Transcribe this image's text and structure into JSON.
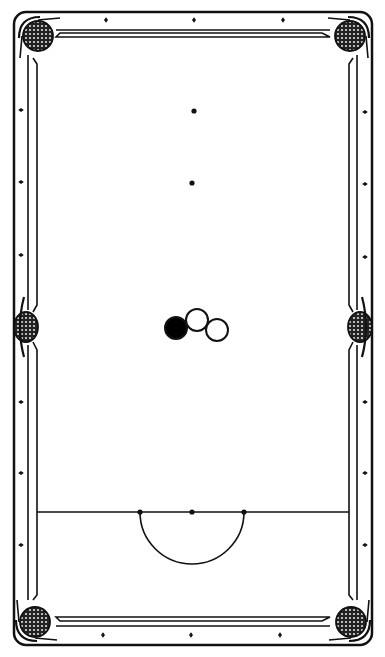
{
  "diagram": {
    "type": "snooker-table",
    "colors": {
      "ink": "#111111",
      "cloth": "#ffffff",
      "pocket_fill": "#333333",
      "cue_ball": "#000000",
      "object_ball": "#ffffff"
    },
    "table": {
      "outer": {
        "x": 14,
        "y": 12,
        "w": 358,
        "h": 633
      },
      "cushion_inner": {
        "x": 37,
        "y": 37,
        "w": 312,
        "h": 580
      }
    },
    "pockets": [
      {
        "name": "top-left",
        "cx": 38,
        "cy": 36
      },
      {
        "name": "top-right",
        "cx": 350,
        "cy": 36
      },
      {
        "name": "middle-left",
        "cx": 26,
        "cy": 327
      },
      {
        "name": "middle-right",
        "cx": 360,
        "cy": 327
      },
      {
        "name": "bottom-left",
        "cx": 35,
        "cy": 622
      },
      {
        "name": "bottom-right",
        "cx": 351,
        "cy": 622
      }
    ],
    "diamonds": {
      "top": [
        {
          "x": 106,
          "y": 20
        },
        {
          "x": 194,
          "y": 20
        },
        {
          "x": 283,
          "y": 20
        }
      ],
      "bottom": [
        {
          "x": 103,
          "y": 635
        },
        {
          "x": 191,
          "y": 635
        },
        {
          "x": 280,
          "y": 635
        }
      ],
      "left": [
        {
          "x": 21,
          "y": 110
        },
        {
          "x": 21,
          "y": 182
        },
        {
          "x": 21,
          "y": 255
        },
        {
          "x": 21,
          "y": 402
        },
        {
          "x": 21,
          "y": 473
        },
        {
          "x": 21,
          "y": 545
        }
      ],
      "right": [
        {
          "x": 365,
          "y": 112
        },
        {
          "x": 365,
          "y": 184
        },
        {
          "x": 365,
          "y": 257
        },
        {
          "x": 365,
          "y": 402
        },
        {
          "x": 365,
          "y": 473
        },
        {
          "x": 365,
          "y": 545
        }
      ]
    },
    "spots": [
      {
        "name": "black-spot",
        "x": 194,
        "y": 111
      },
      {
        "name": "pink-spot",
        "x": 192,
        "y": 183
      }
    ],
    "baulk_line": {
      "y": 512,
      "x1": 37,
      "x2": 349
    },
    "d_semicircle": {
      "cx": 192,
      "cy": 512,
      "r": 52
    },
    "baulk_spots": [
      {
        "name": "yellow-spot",
        "x": 140,
        "y": 512
      },
      {
        "name": "brown-spot",
        "x": 192,
        "y": 512
      },
      {
        "name": "green-spot",
        "x": 244,
        "y": 512
      }
    ],
    "balls": [
      {
        "name": "cue-ball",
        "cx": 176,
        "cy": 328,
        "r": 11,
        "filled": true
      },
      {
        "name": "object-ball-1",
        "cx": 197,
        "cy": 320,
        "r": 11,
        "filled": false
      },
      {
        "name": "object-ball-2",
        "cx": 217,
        "cy": 330,
        "r": 11,
        "filled": false
      }
    ]
  }
}
